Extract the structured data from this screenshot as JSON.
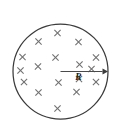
{
  "figure": {
    "name": "uniform-magnetic-field-circular-region",
    "background_color": "#ffffff",
    "width": 120,
    "height": 132
  },
  "region": {
    "shape": "circle",
    "center": {
      "x": 60.5,
      "y": 71.5
    },
    "radius": 47.5,
    "stroke_color": "#3b3b3b",
    "stroke_width": 1.25,
    "fill_color": "#ffffff"
  },
  "field": {
    "symbol": "cross",
    "meaning_label": "into-page",
    "color": "#6f6f6f",
    "arm_half_length": 3.1,
    "count": 17,
    "marks": [
      {
        "x": 57.5,
        "y": 33.0
      },
      {
        "x": 38.5,
        "y": 41.5
      },
      {
        "x": 78.5,
        "y": 42.0
      },
      {
        "x": 22.5,
        "y": 57.0
      },
      {
        "x": 55.5,
        "y": 57.5
      },
      {
        "x": 96.0,
        "y": 57.5
      },
      {
        "x": 38.0,
        "y": 66.5
      },
      {
        "x": 79.5,
        "y": 64.5
      },
      {
        "x": 79.0,
        "y": 79.0
      },
      {
        "x": 24.0,
        "y": 82.0
      },
      {
        "x": 58.5,
        "y": 82.5
      },
      {
        "x": 96.0,
        "y": 82.0
      },
      {
        "x": 38.5,
        "y": 92.5
      },
      {
        "x": 76.5,
        "y": 92.0
      },
      {
        "x": 57.5,
        "y": 108.5
      },
      {
        "x": 91.5,
        "y": 69.0
      },
      {
        "x": 20.5,
        "y": 70.5
      }
    ]
  },
  "radius_arrow": {
    "label": "R",
    "label_position": {
      "x": 78.5,
      "y": 80.0
    },
    "start": {
      "x": 60.5,
      "y": 71.5
    },
    "end": {
      "x": 108.0,
      "y": 71.5
    },
    "line_color": "#4a4a4a",
    "head_color": "#3b3b3b",
    "head_length": 5.5,
    "head_half_width": 3.0
  }
}
